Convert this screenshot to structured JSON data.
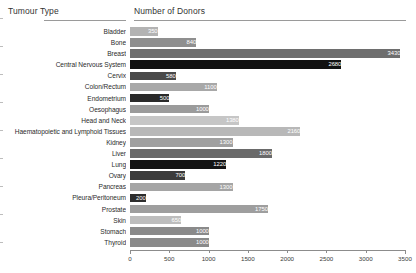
{
  "header": {
    "category_title": "Tumour Type",
    "value_title": "Number of Donors"
  },
  "chart_data": {
    "type": "bar",
    "orientation": "horizontal",
    "title": "",
    "xlabel": "Number of Donors",
    "ylabel": "Tumour Type",
    "xlim": [
      0,
      3500
    ],
    "grid": false,
    "legend": null,
    "ticks": [
      "0",
      "500",
      "1000",
      "1500",
      "2000",
      "2500",
      "3000",
      "3500"
    ],
    "tick_values": [
      0,
      500,
      1000,
      1500,
      2000,
      2500,
      3000,
      3500
    ],
    "categories": [
      "Bladder",
      "Bone",
      "Breast",
      "Central Nervous System",
      "Cervix",
      "Colon/Rectum",
      "Endometrium",
      "Oesophagus",
      "Head and Neck",
      "Haematopoietic and Lymphoid Tissues",
      "Kidney",
      "Liver",
      "Lung",
      "Ovary",
      "Pancreas",
      "Pleura/Peritoneum",
      "Prostate",
      "Skin",
      "Stomach",
      "Thyroid"
    ],
    "values": [
      350,
      840,
      3430,
      2680,
      580,
      1100,
      500,
      1000,
      1380,
      2160,
      1300,
      1800,
      1220,
      700,
      1300,
      200,
      1750,
      650,
      1000,
      1000
    ],
    "labels": [
      "350",
      "840",
      "3430",
      "2680",
      "580",
      "1100",
      "500",
      "1000",
      "1380",
      "2160",
      "1300",
      "1800",
      "1220",
      "700",
      "1300",
      "200",
      "1750",
      "650",
      "1000",
      "1000"
    ],
    "bar_colors": [
      "#b3b3b3",
      "#8f8f8f",
      "#6e6e6e",
      "#111111",
      "#4a4a4a",
      "#a8a8a8",
      "#2a2a2a",
      "#9b9b9b",
      "#c6c6c6",
      "#b8b8b8",
      "#a0a0a0",
      "#6a6a6a",
      "#141414",
      "#3b3b3b",
      "#a5a5a5",
      "#2d2d2d",
      "#9e9e9e",
      "#bdbdbd",
      "#8a8a8a",
      "#8a8a8a"
    ],
    "label_colors": [
      "#ffffff",
      "#ffffff",
      "#ffffff",
      "#ffffff",
      "#ffffff",
      "#ffffff",
      "#ffffff",
      "#ffffff",
      "#ffffff",
      "#ffffff",
      "#ffffff",
      "#ffffff",
      "#ffffff",
      "#ffffff",
      "#ffffff",
      "#ffffff",
      "#ffffff",
      "#ffffff",
      "#ffffff",
      "#ffffff"
    ]
  }
}
